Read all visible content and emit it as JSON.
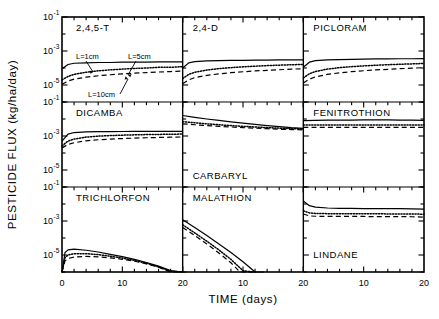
{
  "figure": {
    "axis_labels": {
      "y": "PESTICIDE FLUX (kg/ha/day)",
      "x": "TIME (days)"
    },
    "y_ticks": [
      "10-1",
      "10-3",
      "10-5"
    ],
    "y_tick_mantissa": "10",
    "y_tick_exponents": [
      "-1",
      "-3",
      "-5"
    ],
    "x_ticks_col1": [
      "0",
      "10",
      "20"
    ],
    "x_ticks_col2": [
      "10",
      "20"
    ],
    "x_ticks_col3": [
      "10",
      "20"
    ],
    "legend": [
      {
        "label": "L=1cm",
        "style": "solid"
      },
      {
        "label": "L=5cm",
        "style": "dotted"
      },
      {
        "label": "L=10cm",
        "style": "dashed"
      }
    ],
    "panel_titles": {
      "p00": "2,4,5-T",
      "p01": "2,4-D",
      "p02": "PICLORAM",
      "p10": "DICAMBA",
      "p11": "CARBARYL",
      "p12": "FENITROTHION",
      "p20": "TRICHLORFON",
      "p21": "MALATHION",
      "p22": "LINDANE"
    }
  },
  "chart_data": {
    "type": "line",
    "title": "",
    "xlabel": "TIME (days)",
    "ylabel": "PESTICIDE FLUX (kg/ha/day)",
    "xlim": [
      0,
      20
    ],
    "ylim": [
      1e-06,
      0.1
    ],
    "yscale": "log",
    "ytick_values": [
      0.1,
      0.001,
      1e-05
    ],
    "ytick_labels": [
      "10^-1",
      "10^-3",
      "10^-5"
    ],
    "xtick_values": [
      0,
      10,
      20
    ],
    "grid": false,
    "legend_position": "inside-top-left-panel",
    "series_styles": [
      "solid",
      "dotted",
      "dashed"
    ],
    "series_names": [
      "L=1cm",
      "L=5cm",
      "L=10cm"
    ],
    "panels": [
      {
        "name": "2,4,5-T",
        "row": 0,
        "col": 0,
        "series": [
          {
            "name": "L=1cm",
            "x": [
              0,
              1,
              2,
              4,
              6,
              8,
              10,
              12,
              14,
              16,
              18,
              20
            ],
            "y": [
              9e-05,
              0.00016,
              0.00019,
              0.0002,
              0.00021,
              0.00021,
              0.00022,
              0.00022,
              0.00022,
              0.00023,
              0.00023,
              0.00023
            ]
          },
          {
            "name": "L=5cm",
            "x": [
              0,
              1,
              2,
              4,
              6,
              8,
              10,
              12,
              14,
              16,
              18,
              20
            ],
            "y": [
              2e-05,
              3.2e-05,
              4.2e-05,
              5.6e-05,
              6.8e-05,
              7.8e-05,
              8.6e-05,
              9.4e-05,
              0.0001,
              0.00011,
              0.00011,
              0.00012
            ]
          },
          {
            "name": "L=10cm",
            "x": [
              0,
              1,
              2,
              4,
              6,
              8,
              10,
              12,
              14,
              16,
              18,
              20
            ],
            "y": [
              1.1e-05,
              1.7e-05,
              2.2e-05,
              2.9e-05,
              3.5e-05,
              4e-05,
              4.5e-05,
              5e-05,
              5.4e-05,
              5.8e-05,
              6.2e-05,
              6.6e-05
            ]
          }
        ]
      },
      {
        "name": "2,4-D",
        "row": 0,
        "col": 1,
        "series": [
          {
            "name": "L=1cm",
            "x": [
              0,
              1,
              2,
              4,
              6,
              8,
              10,
              12,
              14,
              16,
              18,
              20
            ],
            "y": [
              0.0001,
              0.0002,
              0.00024,
              0.00026,
              0.00027,
              0.00028,
              0.00028,
              0.00029,
              0.00029,
              0.0003,
              0.0003,
              0.0003
            ]
          },
          {
            "name": "L=5cm",
            "x": [
              0,
              1,
              2,
              4,
              6,
              8,
              10,
              12,
              14,
              16,
              18,
              20
            ],
            "y": [
              2.4e-05,
              4.2e-05,
              5.6e-05,
              7.6e-05,
              9.2e-05,
              0.000105,
              0.000117,
              0.000128,
              0.000138,
              0.000147,
              0.000155,
              0.000162
            ]
          },
          {
            "name": "L=10cm",
            "x": [
              0,
              1,
              2,
              4,
              6,
              8,
              10,
              12,
              14,
              16,
              18,
              20
            ],
            "y": [
              1.2e-05,
              2e-05,
              2.7e-05,
              3.7e-05,
              4.5e-05,
              5.3e-05,
              6e-05,
              6.7e-05,
              7.3e-05,
              7.9e-05,
              8.5e-05,
              9.1e-05
            ]
          }
        ]
      },
      {
        "name": "PICLORAM",
        "row": 0,
        "col": 2,
        "series": [
          {
            "name": "L=1cm",
            "x": [
              0,
              1,
              2,
              4,
              6,
              8,
              10,
              12,
              14,
              16,
              18,
              20
            ],
            "y": [
              0.00011,
              0.00022,
              0.00027,
              0.0003,
              0.00031,
              0.00032,
              0.00033,
              0.00034,
              0.00034,
              0.00035,
              0.00035,
              0.00036
            ]
          },
          {
            "name": "L=5cm",
            "x": [
              0,
              1,
              2,
              4,
              6,
              8,
              10,
              12,
              14,
              16,
              18,
              20
            ],
            "y": [
              2.6e-05,
              4.6e-05,
              6.2e-05,
              8.6e-05,
              0.000105,
              0.00012,
              0.000133,
              0.000145,
              0.000156,
              0.000166,
              0.000175,
              0.000184
            ]
          },
          {
            "name": "L=10cm",
            "x": [
              0,
              1,
              2,
              4,
              6,
              8,
              10,
              12,
              14,
              16,
              18,
              20
            ],
            "y": [
              1.3e-05,
              2.2e-05,
              3e-05,
              4.2e-05,
              5.2e-05,
              6.1e-05,
              6.9e-05,
              7.7e-05,
              8.4e-05,
              9.1e-05,
              9.8e-05,
              0.000105
            ]
          }
        ]
      },
      {
        "name": "DICAMBA",
        "row": 1,
        "col": 0,
        "series": [
          {
            "name": "L=1cm",
            "x": [
              0,
              1,
              2,
              4,
              6,
              8,
              10,
              12,
              14,
              16,
              18,
              20
            ],
            "y": [
              0.0005,
              0.0013,
              0.0016,
              0.00175,
              0.0018,
              0.00182,
              0.00184,
              0.00185,
              0.00186,
              0.00187,
              0.00188,
              0.00188
            ]
          },
          {
            "name": "L=5cm",
            "x": [
              0,
              1,
              2,
              4,
              6,
              8,
              10,
              12,
              14,
              16,
              18,
              20
            ],
            "y": [
              0.00026,
              0.0005,
              0.00066,
              0.00086,
              0.00098,
              0.00106,
              0.00112,
              0.00117,
              0.00121,
              0.00124,
              0.00127,
              0.0013
            ]
          },
          {
            "name": "L=10cm",
            "x": [
              0,
              1,
              2,
              4,
              6,
              8,
              10,
              12,
              14,
              16,
              18,
              20
            ],
            "y": [
              0.0002,
              0.00032,
              0.0004,
              0.00052,
              0.0006,
              0.00066,
              0.00071,
              0.00075,
              0.00079,
              0.00082,
              0.00085,
              0.00088
            ]
          }
        ]
      },
      {
        "name": "CARBARYL",
        "row": 1,
        "col": 1,
        "series": [
          {
            "name": "L=1cm",
            "x": [
              0,
              2,
              4,
              6,
              8,
              10,
              12,
              14,
              16,
              18,
              20
            ],
            "y": [
              0.016,
              0.0125,
              0.01,
              0.0082,
              0.0068,
              0.0057,
              0.0048,
              0.0041,
              0.0036,
              0.0031,
              0.0028
            ]
          },
          {
            "name": "L=5cm",
            "x": [
              0,
              2,
              4,
              6,
              8,
              10,
              12,
              14,
              16,
              18,
              20
            ],
            "y": [
              0.007,
              0.006,
              0.0052,
              0.0046,
              0.0041,
              0.0037,
              0.0034,
              0.0031,
              0.0029,
              0.0027,
              0.0026
            ]
          },
          {
            "name": "L=10cm",
            "x": [
              0,
              2,
              4,
              6,
              8,
              10,
              12,
              14,
              16,
              18,
              20
            ],
            "y": [
              0.0052,
              0.0046,
              0.0041,
              0.0037,
              0.0034,
              0.0031,
              0.0029,
              0.0027,
              0.0025,
              0.0024,
              0.0023
            ]
          }
        ]
      },
      {
        "name": "FENITROTHION",
        "row": 1,
        "col": 2,
        "series": [
          {
            "name": "L=1cm",
            "x": [
              0,
              2,
              4,
              6,
              8,
              10,
              12,
              14,
              16,
              18,
              20
            ],
            "y": [
              0.008,
              0.0083,
              0.0085,
              0.0086,
              0.0087,
              0.0088,
              0.0088,
              0.0088,
              0.0087,
              0.0086,
              0.0084
            ]
          },
          {
            "name": "L=5cm",
            "x": [
              0,
              2,
              4,
              6,
              8,
              10,
              12,
              14,
              16,
              18,
              20
            ],
            "y": [
              0.0044,
              0.0044,
              0.0044,
              0.0044,
              0.0044,
              0.0044,
              0.0044,
              0.0044,
              0.0044,
              0.0044,
              0.0044
            ]
          },
          {
            "name": "L=10cm",
            "x": [
              0,
              2,
              4,
              6,
              8,
              10,
              12,
              14,
              16,
              18,
              20
            ],
            "y": [
              0.0032,
              0.0032,
              0.0032,
              0.0032,
              0.0032,
              0.0032,
              0.0032,
              0.0032,
              0.0032,
              0.0032,
              0.0032
            ]
          }
        ]
      },
      {
        "name": "TRICHLORFON",
        "row": 2,
        "col": 0,
        "series": [
          {
            "name": "L=1cm",
            "x": [
              0,
              0.5,
              1,
              2,
              4,
              6,
              8,
              10,
              12,
              14,
              16,
              18,
              20
            ],
            "y": [
              1e-06,
              1.4e-05,
              2e-05,
              2.2e-05,
              1.9e-05,
              1.5e-05,
              1.1e-05,
              8e-06,
              5.5e-06,
              3.6e-06,
              2.2e-06,
              1.2e-06,
              4e-07
            ]
          },
          {
            "name": "L=5cm",
            "x": [
              0,
              0.5,
              1,
              2,
              4,
              6,
              8,
              10,
              12,
              14,
              16,
              18,
              20
            ],
            "y": [
              1e-06,
              7e-06,
              1e-05,
              1.2e-05,
              1.2e-05,
              1.05e-05,
              8.5e-06,
              6.6e-06,
              4.8e-06,
              3.3e-06,
              2e-06,
              1.1e-06,
              3.8e-07
            ]
          },
          {
            "name": "L=10cm",
            "x": [
              0,
              0.5,
              1,
              2,
              4,
              6,
              8,
              10,
              12,
              14,
              16,
              18,
              20
            ],
            "y": [
              1e-06,
              4.5e-06,
              6.2e-06,
              7.6e-06,
              8.2e-06,
              7.8e-06,
              6.8e-06,
              5.6e-06,
              4.3e-06,
              3e-06,
              1.9e-06,
              1e-06,
              3.6e-07
            ]
          }
        ]
      },
      {
        "name": "MALATHION",
        "row": 2,
        "col": 1,
        "series": [
          {
            "name": "L=1cm",
            "x": [
              0,
              2,
              4,
              6,
              8,
              10,
              12,
              13,
              13.5
            ],
            "y": [
              0.0012,
              0.00042,
              0.00014,
              4.5e-05,
              1.4e-05,
              4e-06,
              9e-07,
              2e-07,
              1e-07
            ]
          },
          {
            "name": "L=5cm",
            "x": [
              0,
              2,
              4,
              6,
              8,
              10,
              11.5,
              12
            ],
            "y": [
              0.0006,
              0.0002,
              6.5e-05,
              2e-05,
              5.5e-06,
              1.2e-06,
              2.2e-07,
              1e-07
            ]
          },
          {
            "name": "L=10cm",
            "x": [
              0,
              2,
              4,
              6,
              8,
              9.5,
              11,
              11.5
            ],
            "y": [
              0.00042,
              0.00014,
              4.5e-05,
              1.3e-05,
              3.5e-06,
              1e-06,
              2e-07,
              1e-07
            ]
          }
        ]
      },
      {
        "name": "LINDANE",
        "row": 2,
        "col": 2,
        "series": [
          {
            "name": "L=1cm",
            "x": [
              0,
              1,
              2,
              4,
              6,
              8,
              10,
              12,
              14,
              16,
              18,
              20
            ],
            "y": [
              0.015,
              0.008,
              0.0066,
              0.0058,
              0.0056,
              0.0055,
              0.0054,
              0.0054,
              0.0053,
              0.0053,
              0.0052,
              0.005
            ]
          },
          {
            "name": "L=5cm",
            "x": [
              0,
              1,
              2,
              4,
              6,
              8,
              10,
              12,
              14,
              16,
              18,
              20
            ],
            "y": [
              0.004,
              0.003,
              0.0028,
              0.0027,
              0.0027,
              0.0027,
              0.0027,
              0.0027,
              0.0026,
              0.0026,
              0.0026,
              0.0025
            ]
          },
          {
            "name": "L=10cm",
            "x": [
              0,
              1,
              2,
              4,
              6,
              8,
              10,
              12,
              14,
              16,
              18,
              20
            ],
            "y": [
              0.0026,
              0.002,
              0.0019,
              0.00185,
              0.00185,
              0.00185,
              0.00185,
              0.0018,
              0.0018,
              0.0018,
              0.00178,
              0.0017
            ]
          }
        ]
      }
    ]
  }
}
